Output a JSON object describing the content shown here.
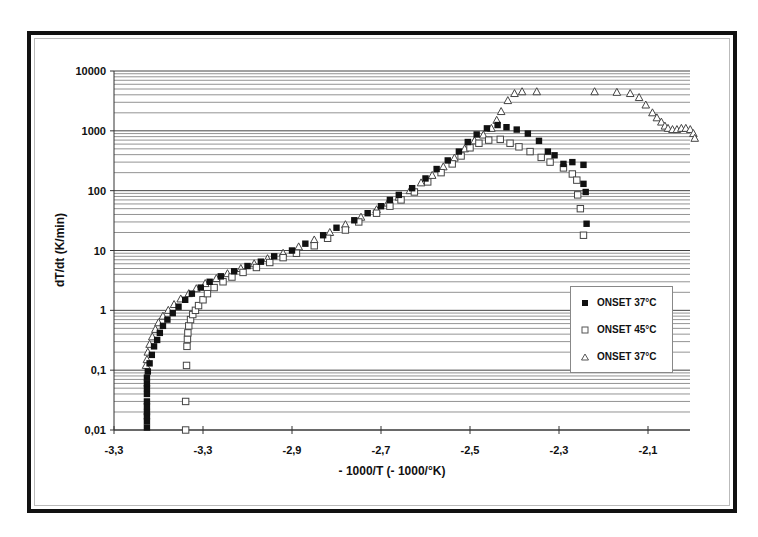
{
  "chart_data": {
    "type": "scatter",
    "title": "",
    "xlabel": "- 1000/T (- 1000/°K)",
    "ylabel": "dT/dt (K/min)",
    "xlim": [
      -3.3,
      -2.0
    ],
    "ylim": [
      0.01,
      10000
    ],
    "yscale": "log",
    "x_tick_positions": [
      -3.3,
      -3.1,
      -2.9,
      -2.7,
      -2.5,
      -2.3,
      -2.1
    ],
    "x_tick_labels": [
      "-3,3",
      "-3,3",
      "-2,9",
      "-2,7",
      "-2,5",
      "-2,3",
      "-2,1"
    ],
    "y_tick_positions": [
      0.01,
      0.1,
      1,
      10,
      100,
      1000,
      10000
    ],
    "y_tick_labels": [
      "0,01",
      "0,1",
      "1",
      "10",
      "100",
      "1000",
      "10000"
    ],
    "grid": "horizontal log minor+major",
    "legend_position": "lower right inside plot",
    "series": [
      {
        "name": "ONSET 37°C",
        "marker": "filled-square",
        "points": [
          [
            -3.226,
            0.011
          ],
          [
            -3.226,
            0.014
          ],
          [
            -3.226,
            0.017
          ],
          [
            -3.226,
            0.02
          ],
          [
            -3.226,
            0.025
          ],
          [
            -3.226,
            0.03
          ],
          [
            -3.226,
            0.04
          ],
          [
            -3.226,
            0.05
          ],
          [
            -3.226,
            0.06
          ],
          [
            -3.226,
            0.075
          ],
          [
            -3.224,
            0.095
          ],
          [
            -3.22,
            0.13
          ],
          [
            -3.215,
            0.18
          ],
          [
            -3.21,
            0.25
          ],
          [
            -3.203,
            0.32
          ],
          [
            -3.197,
            0.42
          ],
          [
            -3.19,
            0.55
          ],
          [
            -3.18,
            0.7
          ],
          [
            -3.168,
            0.9
          ],
          [
            -3.155,
            1.15
          ],
          [
            -3.14,
            1.5
          ],
          [
            -3.125,
            1.9
          ],
          [
            -3.105,
            2.4
          ],
          [
            -3.085,
            3.0
          ],
          [
            -3.06,
            3.7
          ],
          [
            -3.03,
            4.5
          ],
          [
            -3.0,
            5.5
          ],
          [
            -2.97,
            6.5
          ],
          [
            -2.94,
            8.0
          ],
          [
            -2.9,
            10
          ],
          [
            -2.87,
            13
          ],
          [
            -2.83,
            18
          ],
          [
            -2.8,
            24
          ],
          [
            -2.76,
            32
          ],
          [
            -2.73,
            42
          ],
          [
            -2.7,
            55
          ],
          [
            -2.68,
            70
          ],
          [
            -2.66,
            85
          ],
          [
            -2.63,
            110
          ],
          [
            -2.6,
            160
          ],
          [
            -2.575,
            230
          ],
          [
            -2.55,
            320
          ],
          [
            -2.525,
            450
          ],
          [
            -2.505,
            650
          ],
          [
            -2.485,
            870
          ],
          [
            -2.462,
            1100
          ],
          [
            -2.438,
            1250
          ],
          [
            -2.418,
            1150
          ],
          [
            -2.395,
            1050
          ],
          [
            -2.37,
            900
          ],
          [
            -2.345,
            680
          ],
          [
            -2.325,
            450
          ],
          [
            -2.31,
            390
          ],
          [
            -2.29,
            280
          ],
          [
            -2.27,
            300
          ],
          [
            -2.245,
            270
          ],
          [
            -2.245,
            130
          ],
          [
            -2.24,
            95
          ],
          [
            -2.238,
            28
          ]
        ]
      },
      {
        "name": "ONSET 45°C",
        "marker": "open-square",
        "points": [
          [
            -3.139,
            0.01
          ],
          [
            -3.139,
            0.03
          ],
          [
            -3.137,
            0.12
          ],
          [
            -3.136,
            0.25
          ],
          [
            -3.135,
            0.33
          ],
          [
            -3.134,
            0.42
          ],
          [
            -3.132,
            0.55
          ],
          [
            -3.128,
            0.7
          ],
          [
            -3.123,
            0.85
          ],
          [
            -3.117,
            1.0
          ],
          [
            -3.11,
            1.2
          ],
          [
            -3.1,
            1.5
          ],
          [
            -3.09,
            1.9
          ],
          [
            -3.075,
            2.4
          ],
          [
            -3.055,
            3.0
          ],
          [
            -3.035,
            3.6
          ],
          [
            -3.01,
            4.3
          ],
          [
            -2.98,
            5.2
          ],
          [
            -2.95,
            6.3
          ],
          [
            -2.92,
            7.6
          ],
          [
            -2.89,
            9.0
          ],
          [
            -2.85,
            12
          ],
          [
            -2.82,
            16
          ],
          [
            -2.78,
            22
          ],
          [
            -2.75,
            30
          ],
          [
            -2.71,
            42
          ],
          [
            -2.68,
            55
          ],
          [
            -2.655,
            70
          ],
          [
            -2.625,
            95
          ],
          [
            -2.595,
            140
          ],
          [
            -2.565,
            200
          ],
          [
            -2.54,
            280
          ],
          [
            -2.52,
            380
          ],
          [
            -2.5,
            520
          ],
          [
            -2.48,
            620
          ],
          [
            -2.458,
            700
          ],
          [
            -2.432,
            720
          ],
          [
            -2.41,
            620
          ],
          [
            -2.39,
            540
          ],
          [
            -2.365,
            450
          ],
          [
            -2.34,
            360
          ],
          [
            -2.32,
            300
          ],
          [
            -2.29,
            240
          ],
          [
            -2.27,
            190
          ],
          [
            -2.26,
            150
          ],
          [
            -2.258,
            85
          ],
          [
            -2.252,
            50
          ],
          [
            -2.245,
            18
          ]
        ]
      },
      {
        "name": "ONSET 37°C",
        "marker": "open-triangle",
        "points": [
          [
            -3.228,
            0.12
          ],
          [
            -3.226,
            0.15
          ],
          [
            -3.224,
            0.2
          ],
          [
            -3.22,
            0.27
          ],
          [
            -3.214,
            0.36
          ],
          [
            -3.207,
            0.48
          ],
          [
            -3.2,
            0.62
          ],
          [
            -3.19,
            0.8
          ],
          [
            -3.178,
            1.0
          ],
          [
            -3.165,
            1.25
          ],
          [
            -3.15,
            1.55
          ],
          [
            -3.132,
            1.9
          ],
          [
            -3.115,
            2.3
          ],
          [
            -3.095,
            2.8
          ],
          [
            -3.07,
            3.4
          ],
          [
            -3.045,
            4.1
          ],
          [
            -3.015,
            5.0
          ],
          [
            -2.985,
            6.0
          ],
          [
            -2.955,
            7.3
          ],
          [
            -2.92,
            9
          ],
          [
            -2.885,
            11.5
          ],
          [
            -2.85,
            15
          ],
          [
            -2.815,
            20
          ],
          [
            -2.78,
            27
          ],
          [
            -2.745,
            36
          ],
          [
            -2.71,
            48
          ],
          [
            -2.685,
            62
          ],
          [
            -2.66,
            78
          ],
          [
            -2.635,
            100
          ],
          [
            -2.61,
            135
          ],
          [
            -2.585,
            180
          ],
          [
            -2.56,
            250
          ],
          [
            -2.535,
            350
          ],
          [
            -2.512,
            500
          ],
          [
            -2.49,
            680
          ],
          [
            -2.47,
            850
          ],
          [
            -2.452,
            1100
          ],
          [
            -2.44,
            1500
          ],
          [
            -2.43,
            2100
          ],
          [
            -2.415,
            3200
          ],
          [
            -2.4,
            4200
          ],
          [
            -2.383,
            4500
          ],
          [
            -2.35,
            4500
          ],
          [
            -2.22,
            4500
          ],
          [
            -2.17,
            4400
          ],
          [
            -2.14,
            4200
          ],
          [
            -2.12,
            3600
          ],
          [
            -2.105,
            2700
          ],
          [
            -2.09,
            2000
          ],
          [
            -2.08,
            1650
          ],
          [
            -2.07,
            1400
          ],
          [
            -2.062,
            1200
          ],
          [
            -2.055,
            1100
          ],
          [
            -2.045,
            1050
          ],
          [
            -2.035,
            1050
          ],
          [
            -2.025,
            1100
          ],
          [
            -2.015,
            1100
          ],
          [
            -2.005,
            1050
          ],
          [
            -1.998,
            900
          ],
          [
            -1.995,
            750
          ]
        ]
      }
    ]
  },
  "plot": {
    "y_axis_title": "dT/dt (K/min)",
    "x_axis_title": "- 1000/T (- 1000/°K)"
  },
  "legend": {
    "items": [
      {
        "label": "ONSET 37°C",
        "marker": "filled-square"
      },
      {
        "label": "ONSET 45°C",
        "marker": "open-square"
      },
      {
        "label": "ONSET 37°C",
        "marker": "open-triangle"
      }
    ]
  }
}
